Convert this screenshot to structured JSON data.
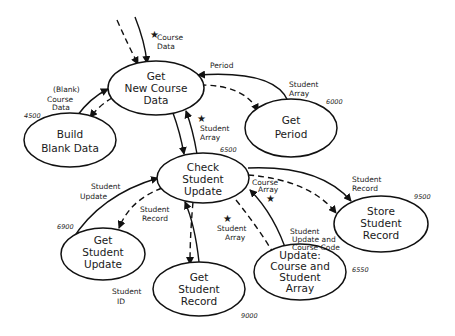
{
  "diagram": {
    "type": "structure-chart",
    "nodes": [
      {
        "id": "get-new-course-data",
        "lines": [
          "Get",
          "New Course",
          "Data"
        ],
        "number": ""
      },
      {
        "id": "build-blank-data",
        "lines": [
          "Build",
          "Blank Data"
        ],
        "number": "4500"
      },
      {
        "id": "get-period",
        "lines": [
          "Get",
          "Period"
        ],
        "number": "6000"
      },
      {
        "id": "check-student-update",
        "lines": [
          "Check",
          "Student",
          "Update"
        ],
        "number": "6500"
      },
      {
        "id": "get-student-update",
        "lines": [
          "Get",
          "Student",
          "Update"
        ],
        "number": "6900"
      },
      {
        "id": "get-student-record",
        "lines": [
          "Get",
          "Student",
          "Record"
        ],
        "number": "9000"
      },
      {
        "id": "update-course-and-student-array",
        "lines": [
          "Update:",
          "Course and",
          "Student",
          "Array"
        ],
        "number": "6550"
      },
      {
        "id": "store-student-record",
        "lines": [
          "Store",
          "Student",
          "Record"
        ],
        "number": "9500"
      }
    ],
    "flow_labels": {
      "course_data_top": [
        "Course",
        "Data"
      ],
      "blank_course_data": [
        "(Blank)",
        "Course",
        "Data"
      ],
      "period": [
        "Period"
      ],
      "student_array_period": [
        "Student",
        "Array"
      ],
      "student_array_check": [
        "Student",
        "Array"
      ],
      "student_update": [
        "Student",
        "Update"
      ],
      "student_record_left": [
        "Student",
        "Record"
      ],
      "course_array": [
        "Course",
        "Array"
      ],
      "student_array_bottom": [
        "Student",
        "Array"
      ],
      "student_update_course_code": [
        "Student",
        "Update and",
        "Course Code"
      ],
      "student_record_right": [
        "Student",
        "Record"
      ],
      "student_id": [
        "Student",
        "ID"
      ]
    },
    "star_symbol": "★"
  }
}
